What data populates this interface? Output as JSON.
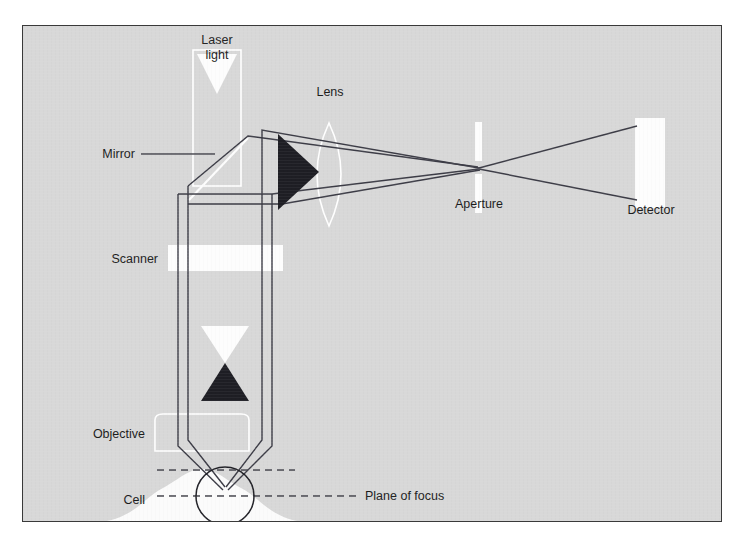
{
  "figure": {
    "kind": "optical-ray-diagram",
    "background_color": "#d8d8d8",
    "frame_border_color": "#3a3a3a",
    "beam_line_color": "#3c3c46",
    "optic_white_color": "#fdfdfd",
    "optic_dark_color": "#1e1e24"
  },
  "labels": {
    "laser_light_line1": "Laser",
    "laser_light_line2": "light",
    "mirror": "Mirror",
    "lens": "Lens",
    "aperture": "Aperture",
    "detector": "Detector",
    "scanner": "Scanner",
    "objective": "Objective",
    "cell": "Cell",
    "plane_of_focus": "Plane of focus"
  },
  "components": [
    {
      "name": "laser-light",
      "label": "Laser light",
      "shape": "vertical-beam-with-down-arrow",
      "fill": "#fdfdfd"
    },
    {
      "name": "mirror",
      "label": "Mirror",
      "shape": "diagonal-line-45deg",
      "fill": "#fdfdfd"
    },
    {
      "name": "lens",
      "label": "Lens",
      "shape": "biconvex-lens-outline",
      "fill": "#fdfdfd"
    },
    {
      "name": "aperture",
      "label": "Aperture",
      "shape": "two-vertical-bars-with-pinhole-gap",
      "fill": "#fdfdfd"
    },
    {
      "name": "detector",
      "label": "Detector",
      "shape": "rectangle",
      "fill": "#fdfdfd"
    },
    {
      "name": "scanner",
      "label": "Scanner",
      "shape": "horizontal-bar",
      "fill": "#fdfdfd"
    },
    {
      "name": "objective",
      "label": "Objective",
      "shape": "rounded-trapezoid-outline",
      "fill": "#fdfdfd"
    },
    {
      "name": "cell",
      "label": "Cell",
      "shape": "circle-on-bell-curve",
      "fill": "#fdfdfd"
    },
    {
      "name": "plane-of-focus",
      "label": "Plane of focus",
      "shape": "dashed-horizontal-line",
      "fill": "none"
    }
  ],
  "arrows": [
    {
      "name": "laser-down-arrow-top",
      "direction": "down",
      "color": "#fdfdfd"
    },
    {
      "name": "excitation-down-arrow",
      "direction": "down",
      "color": "#fdfdfd"
    },
    {
      "name": "emission-up-arrow",
      "direction": "up",
      "color": "#1e1e24"
    },
    {
      "name": "detection-right-arrow",
      "direction": "right",
      "color": "#1e1e24"
    }
  ]
}
